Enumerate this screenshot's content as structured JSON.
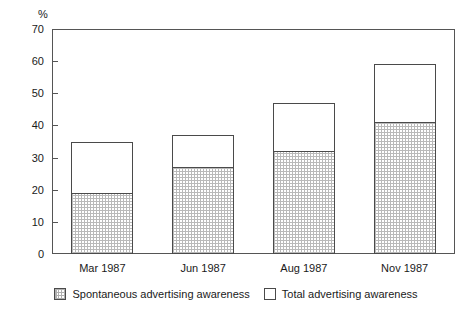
{
  "chart_data": {
    "type": "bar",
    "stacked": true,
    "title": "",
    "xlabel": "",
    "ylabel": "%",
    "ylim": [
      0,
      70
    ],
    "yticks": [
      0,
      10,
      20,
      30,
      40,
      50,
      60,
      70
    ],
    "grid": false,
    "legend_position": "bottom",
    "categories": [
      "Mar 1987",
      "Jun 1987",
      "Aug 1987",
      "Nov 1987"
    ],
    "series": [
      {
        "name": "Spontaneous advertising awareness",
        "fill": "hatched",
        "values": [
          19,
          27,
          32,
          41
        ]
      },
      {
        "name": "Total advertising awareness",
        "fill": "white",
        "values": [
          35,
          37,
          47,
          59
        ]
      }
    ]
  },
  "axis": {
    "unit_label": "%",
    "tick_labels": [
      "70",
      "60",
      "50",
      "40",
      "30",
      "20",
      "10",
      "0"
    ]
  },
  "legend": {
    "items": [
      {
        "label": "Spontaneous advertising awareness",
        "swatch": "hatched-swatch"
      },
      {
        "label": "Total advertising awareness",
        "swatch": "white-swatch"
      }
    ]
  },
  "colors": {
    "frame": "#555555",
    "bar_outline": "#4a4a4a",
    "hatch": "#b9b9b9",
    "background": "#ffffff",
    "text": "#1a1a1a"
  }
}
